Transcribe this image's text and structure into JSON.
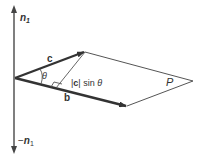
{
  "diagram": {
    "labels": {
      "n_top": "n",
      "n_top_sub": "1",
      "n_bottom_prefix": "−",
      "n_bottom": "n",
      "n_bottom_sub": "1",
      "vec_c": "c",
      "vec_b": "b",
      "theta": "θ",
      "height_bar_open": "|",
      "height_c": "c",
      "height_bar_close": "| sin ",
      "height_theta": "θ",
      "plane": "P"
    },
    "colors": {
      "line": "#444444",
      "thin_line": "#555555",
      "text": "#333333"
    }
  }
}
